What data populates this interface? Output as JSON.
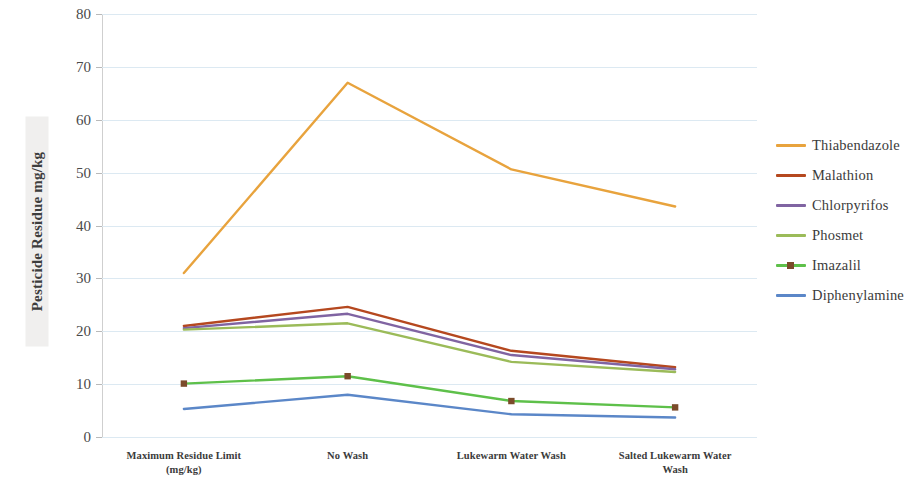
{
  "chart_data": {
    "type": "line",
    "title": "",
    "xlabel": "",
    "ylabel": "Pesticide Residue mg/kg",
    "ylim": [
      0,
      80
    ],
    "ytick_step": 10,
    "yticks": [
      "80",
      "70",
      "60",
      "50",
      "40",
      "30",
      "20",
      "10",
      "0"
    ],
    "grid": true,
    "legend_position": "right",
    "categories": [
      "Maximum Residue Limit (mg/kg)",
      "No Wash",
      "Lukewarm Water Wash",
      "Salted Lukewarm Water Wash"
    ],
    "category_lines": [
      [
        "Maximum Residue Limit",
        "(mg/kg)"
      ],
      [
        "No Wash"
      ],
      [
        "Lukewarm Water Wash"
      ],
      [
        "Salted Lukewarm Water",
        "Wash"
      ]
    ],
    "series": [
      {
        "name": "Thiabendazole",
        "color": "#e8a33d",
        "marker": false,
        "values": [
          31.0,
          67.0,
          50.6,
          43.6
        ]
      },
      {
        "name": "Malathion",
        "color": "#b5481f",
        "marker": false,
        "values": [
          21.0,
          24.6,
          16.3,
          13.2
        ]
      },
      {
        "name": "Chlorpyrifos",
        "color": "#8064a2",
        "marker": false,
        "values": [
          20.6,
          23.3,
          15.5,
          12.8
        ]
      },
      {
        "name": "Phosmet",
        "color": "#9bbb59",
        "marker": false,
        "values": [
          20.3,
          21.5,
          14.2,
          12.3
        ]
      },
      {
        "name": "Imazalil",
        "color": "#5ec04a",
        "marker": true,
        "marker_color": "#7b4b2a",
        "values": [
          10.1,
          11.5,
          6.8,
          5.6
        ]
      },
      {
        "name": "Diphenylamine",
        "color": "#5b87c8",
        "marker": false,
        "values": [
          5.3,
          8.0,
          4.3,
          3.7
        ]
      }
    ]
  }
}
